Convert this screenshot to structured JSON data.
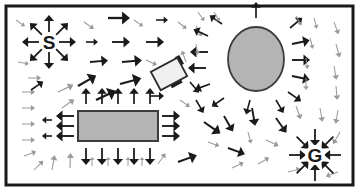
{
  "diagram": {
    "type": "vector-field",
    "canvas": {
      "width": 359,
      "height": 191,
      "background": "#ffffff"
    },
    "frame": {
      "name": "workspace-border",
      "x": 6,
      "y": 6,
      "width": 347,
      "height": 179,
      "stroke": "#1a1a1a",
      "stroke_width": 3,
      "fill": "#ffffff"
    },
    "colors": {
      "arrow_strong": "#1a1a1a",
      "arrow_weak": "#9a9a9a",
      "obstacle_fill": "#b4b4b4",
      "obstacle_stroke": "#3c3c3c",
      "robot_fill": "#f0f0f0",
      "robot_stroke": "#2b2b2b",
      "wheel_fill": "#1f1f1f",
      "border": "#1a1a1a"
    },
    "labels": [
      {
        "name": "start-label",
        "text": "S",
        "x": 49,
        "y": 42,
        "font_size": 19
      },
      {
        "name": "goal-label",
        "text": "G",
        "x": 315,
        "y": 155,
        "font_size": 19
      }
    ],
    "obstacles": [
      {
        "name": "ellipse-obstacle",
        "shape": "ellipse",
        "cx": 256,
        "cy": 59,
        "rx": 28,
        "ry": 32
      },
      {
        "name": "rectangle-obstacle",
        "shape": "rect",
        "x": 78,
        "y": 111,
        "width": 80,
        "height": 30
      }
    ],
    "robot": {
      "name": "robot-body",
      "cx": 169,
      "cy": 74,
      "width": 30,
      "height": 21,
      "rotation_deg": -28,
      "wheels": [
        {
          "name": "robot-wheel-front",
          "x": 13,
          "y": -12,
          "width": 5,
          "height": 10
        },
        {
          "name": "robot-wheel-rear",
          "x": -4,
          "y": 9,
          "width": 12,
          "height": 5
        }
      ]
    },
    "sources": [
      {
        "name": "start-repulsor",
        "cx": 49,
        "cy": 42,
        "mode": "outward",
        "count": 8,
        "inner": 10,
        "outer": 27,
        "weight": "strong"
      },
      {
        "name": "goal-attractor",
        "cx": 315,
        "cy": 155,
        "mode": "inward",
        "count": 8,
        "inner": 9,
        "outer": 26,
        "weight": "strong"
      }
    ],
    "chart_data": {
      "type": "scatter",
      "title": "Artificial potential field navigation map",
      "xlabel": "x (workspace)",
      "ylabel": "y (workspace)",
      "xlim": [
        6,
        353
      ],
      "ylim": [
        6,
        185
      ],
      "grid": false,
      "legend": [
        {
          "label": "S (start, repulsive source)",
          "marker": "text-S"
        },
        {
          "label": "G (goal, attractive sink)",
          "marker": "text-G"
        },
        {
          "label": "obstacle (repulsive)",
          "marker": "gray-shape"
        },
        {
          "label": "robot",
          "marker": "white-rect"
        },
        {
          "label": "strong field vector",
          "marker": "black-arrow"
        },
        {
          "label": "weak field vector",
          "marker": "gray-arrow"
        }
      ],
      "vectors": [
        {
          "x": 28,
          "y": 78,
          "angle": 0,
          "len": 13,
          "weight": "weak"
        },
        {
          "x": 22,
          "y": 92,
          "angle": 0,
          "len": 13,
          "weight": "weak"
        },
        {
          "x": 22,
          "y": 108,
          "angle": 0,
          "len": 13,
          "weight": "weak"
        },
        {
          "x": 22,
          "y": 124,
          "angle": 0,
          "len": 13,
          "weight": "weak"
        },
        {
          "x": 22,
          "y": 140,
          "angle": 0,
          "len": 13,
          "weight": "weak"
        },
        {
          "x": 24,
          "y": 156,
          "angle": -20,
          "len": 13,
          "weight": "weak"
        },
        {
          "x": 18,
          "y": 62,
          "angle": 10,
          "len": 11,
          "weight": "weak"
        },
        {
          "x": 16,
          "y": 20,
          "angle": 35,
          "len": 11,
          "weight": "weak"
        },
        {
          "x": 34,
          "y": 170,
          "angle": -45,
          "len": 13,
          "weight": "weak"
        },
        {
          "x": 52,
          "y": 170,
          "angle": -80,
          "len": 15,
          "weight": "weak"
        },
        {
          "x": 70,
          "y": 168,
          "angle": -88,
          "len": 15,
          "weight": "weak"
        },
        {
          "x": 31,
          "y": 90,
          "angle": -35,
          "len": 15,
          "weight": "strong"
        },
        {
          "x": 78,
          "y": 86,
          "angle": -30,
          "len": 21,
          "weight": "strong"
        },
        {
          "x": 58,
          "y": 92,
          "angle": -25,
          "len": 17,
          "weight": "weak"
        },
        {
          "x": 96,
          "y": 100,
          "angle": -25,
          "len": 22,
          "weight": "strong"
        },
        {
          "x": 62,
          "y": 108,
          "angle": -35,
          "len": 15,
          "weight": "weak"
        },
        {
          "x": 84,
          "y": 22,
          "angle": 35,
          "len": 12,
          "weight": "weak"
        },
        {
          "x": 108,
          "y": 18,
          "angle": 0,
          "len": 22,
          "weight": "strong"
        },
        {
          "x": 134,
          "y": 20,
          "angle": 35,
          "len": 11,
          "weight": "weak"
        },
        {
          "x": 156,
          "y": 20,
          "angle": 0,
          "len": 12,
          "weight": "strong"
        },
        {
          "x": 178,
          "y": 22,
          "angle": 38,
          "len": 11,
          "weight": "weak"
        },
        {
          "x": 196,
          "y": 26,
          "angle": 60,
          "len": 12,
          "weight": "weak"
        },
        {
          "x": 86,
          "y": 42,
          "angle": 0,
          "len": 12,
          "weight": "strong"
        },
        {
          "x": 112,
          "y": 42,
          "angle": 0,
          "len": 18,
          "weight": "strong"
        },
        {
          "x": 146,
          "y": 42,
          "angle": 0,
          "len": 18,
          "weight": "strong"
        },
        {
          "x": 90,
          "y": 62,
          "angle": -5,
          "len": 18,
          "weight": "strong"
        },
        {
          "x": 122,
          "y": 62,
          "angle": -5,
          "len": 20,
          "weight": "strong"
        },
        {
          "x": 146,
          "y": 60,
          "angle": 25,
          "len": 12,
          "weight": "weak"
        },
        {
          "x": 120,
          "y": 84,
          "angle": -15,
          "len": 22,
          "weight": "strong"
        },
        {
          "x": 150,
          "y": 96,
          "angle": 0,
          "len": 14,
          "weight": "strong"
        },
        {
          "x": 86,
          "y": 104,
          "angle": -90,
          "len": 16,
          "weight": "strong"
        },
        {
          "x": 102,
          "y": 104,
          "angle": -90,
          "len": 16,
          "weight": "strong"
        },
        {
          "x": 118,
          "y": 104,
          "angle": -90,
          "len": 16,
          "weight": "strong"
        },
        {
          "x": 134,
          "y": 104,
          "angle": -90,
          "len": 16,
          "weight": "strong"
        },
        {
          "x": 150,
          "y": 104,
          "angle": -90,
          "len": 16,
          "weight": "strong"
        },
        {
          "x": 86,
          "y": 148,
          "angle": 90,
          "len": 17,
          "weight": "strong"
        },
        {
          "x": 102,
          "y": 148,
          "angle": 90,
          "len": 17,
          "weight": "strong"
        },
        {
          "x": 118,
          "y": 148,
          "angle": 90,
          "len": 17,
          "weight": "strong"
        },
        {
          "x": 134,
          "y": 148,
          "angle": 90,
          "len": 17,
          "weight": "strong"
        },
        {
          "x": 150,
          "y": 148,
          "angle": 90,
          "len": 17,
          "weight": "strong"
        },
        {
          "x": 74,
          "y": 116,
          "angle": 180,
          "len": 18,
          "weight": "strong"
        },
        {
          "x": 74,
          "y": 126,
          "angle": 180,
          "len": 18,
          "weight": "strong"
        },
        {
          "x": 74,
          "y": 136,
          "angle": 180,
          "len": 18,
          "weight": "strong"
        },
        {
          "x": 52,
          "y": 120,
          "angle": 180,
          "len": 10,
          "weight": "strong"
        },
        {
          "x": 52,
          "y": 136,
          "angle": 180,
          "len": 10,
          "weight": "strong"
        },
        {
          "x": 162,
          "y": 116,
          "angle": 0,
          "len": 18,
          "weight": "strong"
        },
        {
          "x": 162,
          "y": 126,
          "angle": 0,
          "len": 18,
          "weight": "strong"
        },
        {
          "x": 162,
          "y": 136,
          "angle": 0,
          "len": 18,
          "weight": "strong"
        },
        {
          "x": 92,
          "y": 166,
          "angle": -90,
          "len": 9,
          "weight": "weak"
        },
        {
          "x": 108,
          "y": 166,
          "angle": -90,
          "len": 9,
          "weight": "weak"
        },
        {
          "x": 128,
          "y": 166,
          "angle": -90,
          "len": 9,
          "weight": "weak"
        },
        {
          "x": 142,
          "y": 166,
          "angle": -90,
          "len": 9,
          "weight": "weak"
        },
        {
          "x": 158,
          "y": 164,
          "angle": -55,
          "len": 13,
          "weight": "weak"
        },
        {
          "x": 178,
          "y": 162,
          "angle": -20,
          "len": 20,
          "weight": "strong"
        },
        {
          "x": 208,
          "y": 36,
          "angle": 205,
          "len": 16,
          "weight": "strong"
        },
        {
          "x": 208,
          "y": 52,
          "angle": 180,
          "len": 18,
          "weight": "strong"
        },
        {
          "x": 206,
          "y": 68,
          "angle": 180,
          "len": 18,
          "weight": "strong"
        },
        {
          "x": 210,
          "y": 84,
          "angle": 160,
          "len": 16,
          "weight": "strong"
        },
        {
          "x": 222,
          "y": 24,
          "angle": 215,
          "len": 15,
          "weight": "strong"
        },
        {
          "x": 224,
          "y": 98,
          "angle": 145,
          "len": 15,
          "weight": "strong"
        },
        {
          "x": 256,
          "y": 18,
          "angle": -90,
          "len": 16,
          "weight": "strong"
        },
        {
          "x": 250,
          "y": 100,
          "angle": 105,
          "len": 15,
          "weight": "strong"
        },
        {
          "x": 276,
          "y": 100,
          "angle": 60,
          "len": 15,
          "weight": "strong"
        },
        {
          "x": 290,
          "y": 28,
          "angle": -40,
          "len": 16,
          "weight": "strong"
        },
        {
          "x": 292,
          "y": 44,
          "angle": -12,
          "len": 18,
          "weight": "strong"
        },
        {
          "x": 292,
          "y": 60,
          "angle": 0,
          "len": 18,
          "weight": "strong"
        },
        {
          "x": 292,
          "y": 76,
          "angle": 12,
          "len": 18,
          "weight": "strong"
        },
        {
          "x": 288,
          "y": 92,
          "angle": 35,
          "len": 16,
          "weight": "strong"
        },
        {
          "x": 198,
          "y": 12,
          "angle": 55,
          "len": 11,
          "weight": "weak"
        },
        {
          "x": 214,
          "y": 12,
          "angle": 60,
          "len": 11,
          "weight": "weak"
        },
        {
          "x": 296,
          "y": 16,
          "angle": 60,
          "len": 11,
          "weight": "weak"
        },
        {
          "x": 314,
          "y": 18,
          "angle": 75,
          "len": 11,
          "weight": "weak"
        },
        {
          "x": 334,
          "y": 22,
          "angle": 70,
          "len": 13,
          "weight": "weak"
        },
        {
          "x": 196,
          "y": 44,
          "angle": 80,
          "len": 11,
          "weight": "weak"
        },
        {
          "x": 310,
          "y": 38,
          "angle": 75,
          "len": 11,
          "weight": "weak"
        },
        {
          "x": 336,
          "y": 44,
          "angle": 75,
          "len": 14,
          "weight": "weak"
        },
        {
          "x": 306,
          "y": 58,
          "angle": 82,
          "len": 11,
          "weight": "weak"
        },
        {
          "x": 334,
          "y": 66,
          "angle": 80,
          "len": 14,
          "weight": "weak"
        },
        {
          "x": 306,
          "y": 78,
          "angle": 90,
          "len": 12,
          "weight": "weak"
        },
        {
          "x": 336,
          "y": 86,
          "angle": 85,
          "len": 14,
          "weight": "weak"
        },
        {
          "x": 196,
          "y": 100,
          "angle": 60,
          "len": 15,
          "weight": "strong"
        },
        {
          "x": 224,
          "y": 116,
          "angle": 60,
          "len": 18,
          "weight": "strong"
        },
        {
          "x": 252,
          "y": 108,
          "angle": 80,
          "len": 18,
          "weight": "strong"
        },
        {
          "x": 248,
          "y": 132,
          "angle": 75,
          "len": 12,
          "weight": "weak"
        },
        {
          "x": 204,
          "y": 122,
          "angle": 35,
          "len": 20,
          "weight": "strong"
        },
        {
          "x": 208,
          "y": 142,
          "angle": 20,
          "len": 12,
          "weight": "weak"
        },
        {
          "x": 228,
          "y": 148,
          "angle": 20,
          "len": 18,
          "weight": "strong"
        },
        {
          "x": 232,
          "y": 168,
          "angle": -25,
          "len": 13,
          "weight": "weak"
        },
        {
          "x": 258,
          "y": 164,
          "angle": -30,
          "len": 13,
          "weight": "weak"
        },
        {
          "x": 266,
          "y": 140,
          "angle": 25,
          "len": 14,
          "weight": "weak"
        },
        {
          "x": 276,
          "y": 118,
          "angle": 55,
          "len": 18,
          "weight": "strong"
        },
        {
          "x": 296,
          "y": 106,
          "angle": 70,
          "len": 14,
          "weight": "weak"
        },
        {
          "x": 320,
          "y": 108,
          "angle": 80,
          "len": 14,
          "weight": "weak"
        },
        {
          "x": 338,
          "y": 110,
          "angle": 100,
          "len": 14,
          "weight": "weak"
        },
        {
          "x": 340,
          "y": 132,
          "angle": 120,
          "len": 14,
          "weight": "weak"
        },
        {
          "x": 190,
          "y": 82,
          "angle": 50,
          "len": 14,
          "weight": "strong"
        },
        {
          "x": 186,
          "y": 62,
          "angle": 250,
          "len": 12,
          "weight": "weak"
        },
        {
          "x": 180,
          "y": 100,
          "angle": 35,
          "len": 12,
          "weight": "weak"
        },
        {
          "x": 338,
          "y": 172,
          "angle": 160,
          "len": 13,
          "weight": "weak"
        },
        {
          "x": 288,
          "y": 172,
          "angle": -15,
          "len": 13,
          "weight": "weak"
        }
      ]
    }
  }
}
